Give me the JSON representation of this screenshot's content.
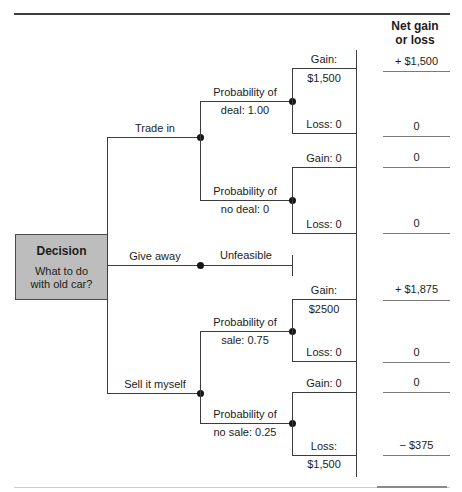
{
  "figure": {
    "column_header": {
      "line1": "Net gain",
      "line2": "or loss"
    },
    "colors": {
      "box_fill": "#bdbdbd",
      "tree_line": "#3c3c3c",
      "net_underline": "#7a7a7a"
    }
  },
  "decision_box": {
    "title": "Decision",
    "question_line1": "What to do",
    "question_line2": "with old car?"
  },
  "branches": [
    {
      "label": "Trade in",
      "chance_nodes": [
        {
          "line1": "Probability of",
          "line2": "deal: 1.00",
          "outcomes": [
            {
              "label": "Gain:",
              "amount_below": "$1,500",
              "net": "+ $1,500"
            },
            {
              "label": "Loss: 0",
              "net": "0"
            }
          ]
        },
        {
          "line1": "Probability of",
          "line2": "no deal: 0",
          "outcomes": [
            {
              "label": "Gain: 0",
              "net": "0"
            },
            {
              "label": "Loss: 0",
              "net": "0"
            }
          ]
        }
      ]
    },
    {
      "label": "Give away",
      "result": "Unfeasible"
    },
    {
      "label": "Sell it myself",
      "chance_nodes": [
        {
          "line1": "Probability of",
          "line2": "sale: 0.75",
          "outcomes": [
            {
              "label": "Gain:",
              "amount_below": "$2500",
              "net": "+ $1,875"
            },
            {
              "label": "Loss: 0",
              "net": "0"
            }
          ]
        },
        {
          "line1": "Probability of",
          "line2": "no sale: 0.25",
          "outcomes": [
            {
              "label": "Gain: 0",
              "net": "0"
            },
            {
              "label": "Loss:",
              "amount_below": "$1,500",
              "net": "− $375"
            }
          ]
        }
      ]
    }
  ]
}
